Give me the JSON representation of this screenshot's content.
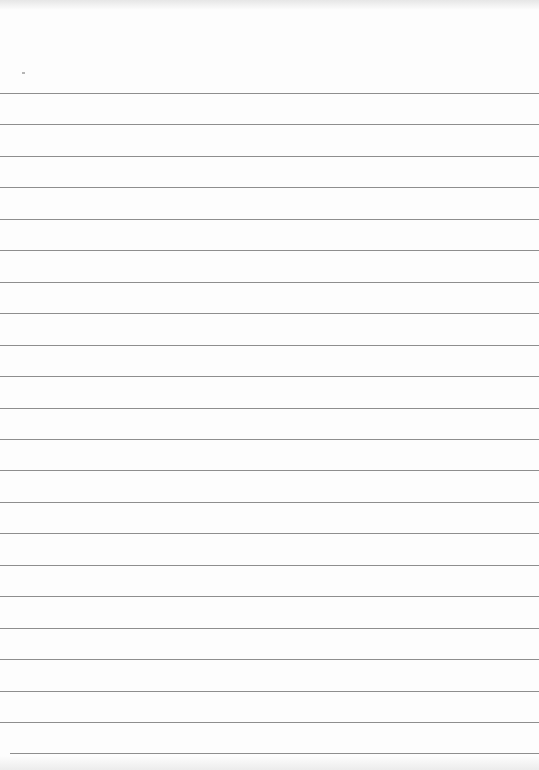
{
  "paper": {
    "type": "lined-paper",
    "background_color": "#fdfdfd",
    "line_color": "#8e8e8e",
    "first_line_y": 93,
    "line_spacing": 31.45,
    "line_count": 22
  }
}
